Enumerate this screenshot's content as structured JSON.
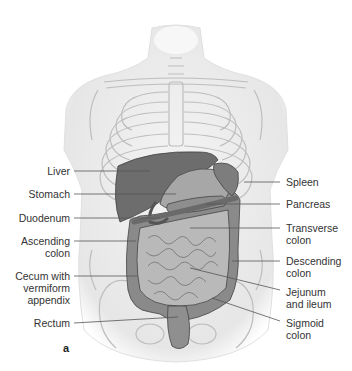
{
  "figure": {
    "panel_label": "a",
    "labels_left": [
      {
        "id": "liver",
        "lines": [
          "Liver"
        ]
      },
      {
        "id": "stomach",
        "lines": [
          "Stomach"
        ]
      },
      {
        "id": "duodenum",
        "lines": [
          "Duodenum"
        ]
      },
      {
        "id": "ascending-colon",
        "lines": [
          "Ascending",
          "colon"
        ]
      },
      {
        "id": "cecum",
        "lines": [
          "Cecum with",
          "vermiform",
          "appendix"
        ]
      },
      {
        "id": "rectum",
        "lines": [
          "Rectum"
        ]
      }
    ],
    "labels_right": [
      {
        "id": "spleen",
        "lines": [
          "Spleen"
        ]
      },
      {
        "id": "pancreas",
        "lines": [
          "Pancreas"
        ]
      },
      {
        "id": "transverse-colon",
        "lines": [
          "Transverse",
          "colon"
        ]
      },
      {
        "id": "descending-colon",
        "lines": [
          "Descending",
          "colon"
        ]
      },
      {
        "id": "jejunum-ileum",
        "lines": [
          "Jejunum",
          "and ileum"
        ]
      },
      {
        "id": "sigmoid-colon",
        "lines": [
          "Sigmoid",
          "colon"
        ]
      }
    ],
    "colors": {
      "body": "#efefef",
      "outline": "#bdbdbd",
      "liver": "#6f6f6f",
      "organ_dark": "#7e7e7e",
      "organ_mid": "#9a9a9a",
      "intestine": "#b8b8b8",
      "leader_line": "#555555",
      "text": "#333333"
    }
  }
}
